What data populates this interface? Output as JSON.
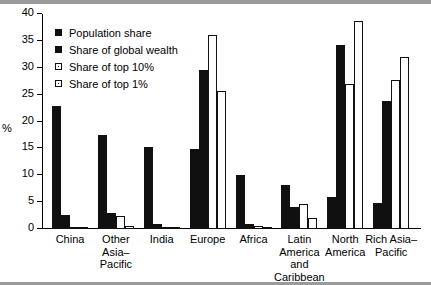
{
  "chart_data": {
    "type": "bar",
    "title": "",
    "xlabel": "",
    "ylabel": "%",
    "ylim": [
      0,
      40
    ],
    "yticks": [
      0,
      5,
      10,
      15,
      20,
      25,
      30,
      35,
      40
    ],
    "ytick_labels": [
      "0",
      "5",
      "10",
      "15",
      "20",
      "25",
      "30",
      "35",
      "40"
    ],
    "grid": false,
    "legend_position": "top-left",
    "categories": [
      "China",
      "Other\nAsia–\nPacific",
      "India",
      "Europe",
      "Africa",
      "Latin\nAmerica\nand\nCaribbean",
      "North\nAmerica",
      "Rich Asia–\nPacific"
    ],
    "series": [
      {
        "name": "Population share",
        "fill": "solid",
        "values": [
          22.8,
          17.4,
          15.3,
          14.9,
          10.1,
          8.1,
          6.0,
          4.8
        ]
      },
      {
        "name": "Share of global wealth",
        "fill": "solid",
        "values": [
          2.7,
          3.0,
          0.9,
          29.5,
          0.9,
          4.1,
          34.2,
          23.9
        ]
      },
      {
        "name": "Share of top 10%",
        "fill": "hollow",
        "values": [
          0.2,
          2.4,
          0.2,
          36.1,
          0.6,
          4.6,
          27.0,
          27.8
        ]
      },
      {
        "name": "Share of top 1%",
        "fill": "hollow",
        "values": [
          0.2,
          0.6,
          0.2,
          25.7,
          0.2,
          2.1,
          38.7,
          32.0
        ]
      }
    ],
    "colors": {
      "solid": "#101010",
      "hollow": "#ffffff",
      "outline": "#101010",
      "axis": "#000000"
    }
  }
}
